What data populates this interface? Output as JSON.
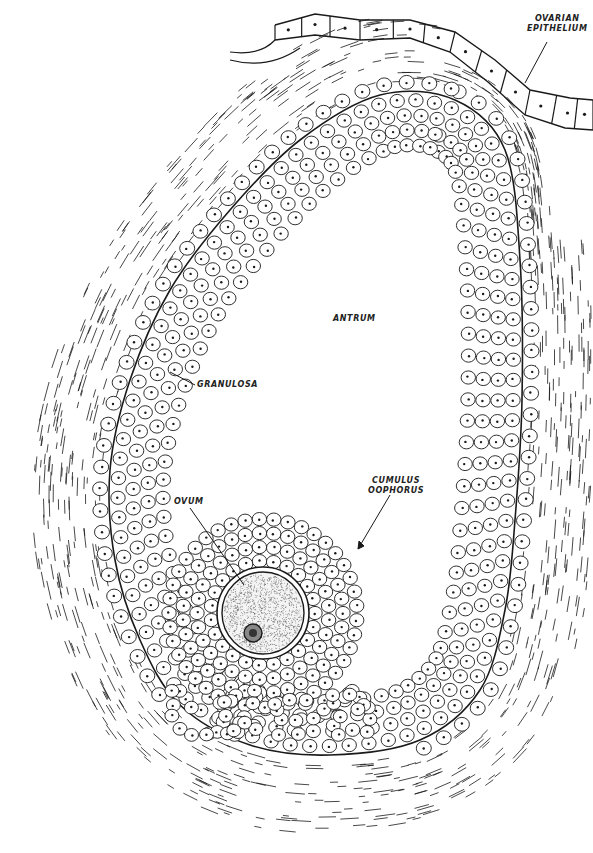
{
  "figure": {
    "width": 593,
    "height": 853,
    "line_color": "#1a1a1a",
    "background": "#ffffff"
  },
  "labels": {
    "ovarian_epithelium_line1": "OVARIAN",
    "ovarian_epithelium_line2": "EPITHELIUM",
    "antrum": "ANTRUM",
    "granulosa": "GRANULOSA",
    "cumulus_line1": "CUMULUS",
    "cumulus_line2": "OOPHORUS",
    "ovum": "OVUM"
  },
  "structures": [
    {
      "id": "ovarian-epithelium",
      "name": "Ovarian epithelium",
      "type": "cuboidal cell row"
    },
    {
      "id": "theca",
      "name": "Theca (fibrous outer layer)",
      "type": "fiber strokes"
    },
    {
      "id": "basement-membrane",
      "name": "Basement membrane",
      "type": "curve"
    },
    {
      "id": "granulosa",
      "name": "Granulosa",
      "type": "cell layers"
    },
    {
      "id": "antrum",
      "name": "Antrum",
      "type": "fluid-filled cavity"
    },
    {
      "id": "cumulus-oophorus",
      "name": "Cumulus oophorus",
      "type": "cell mound"
    },
    {
      "id": "ovum",
      "name": "Ovum",
      "type": "oocyte with zona pellucida and nucleus"
    }
  ]
}
